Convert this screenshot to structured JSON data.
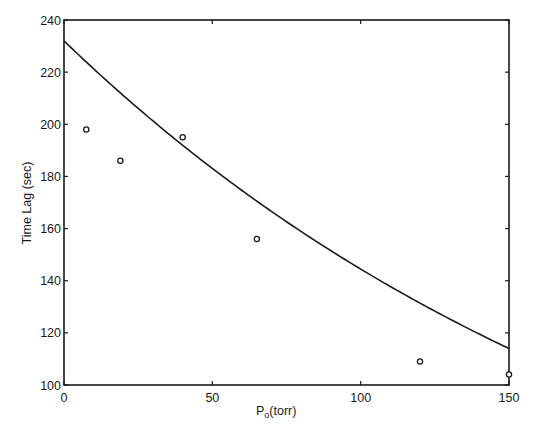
{
  "chart_data": {
    "type": "scatter",
    "title": "",
    "xlabel": "P",
    "xlabel_subscript": "o",
    "xlabel_suffix": "(torr)",
    "ylabel": "Time Lag (sec)",
    "xlim": [
      0,
      150
    ],
    "ylim": [
      100,
      240
    ],
    "xticks": [
      0,
      50,
      100,
      150
    ],
    "yticks": [
      100,
      120,
      140,
      160,
      180,
      200,
      220,
      240
    ],
    "grid": false,
    "legend": null,
    "series": [
      {
        "name": "measured",
        "style": "open-circle markers",
        "x": [
          7.5,
          19,
          40,
          65,
          120,
          150
        ],
        "y": [
          198,
          186,
          195,
          156,
          109,
          104
        ]
      },
      {
        "name": "fit",
        "style": "solid line",
        "x": [
          0,
          25,
          50,
          75,
          100,
          125,
          150
        ],
        "y": [
          232,
          206,
          183,
          162,
          144,
          128,
          114
        ]
      }
    ]
  }
}
